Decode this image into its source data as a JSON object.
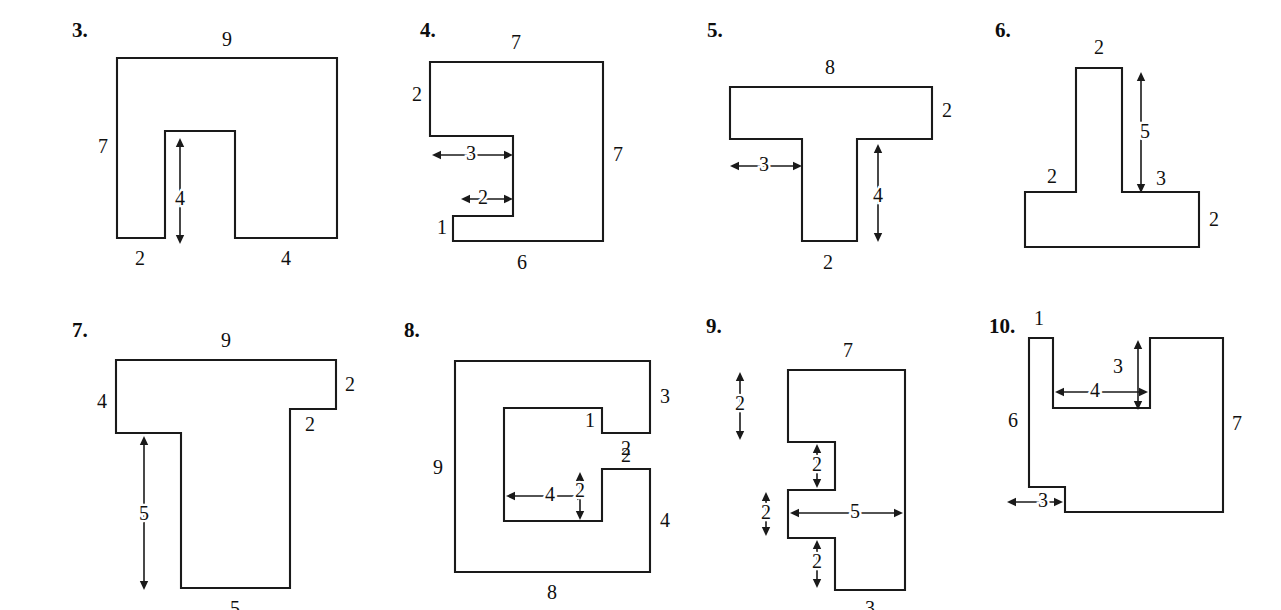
{
  "page": {
    "background_color": "#ffffff",
    "ink_color": "#1a1a1a",
    "problem_count": 8
  },
  "problems": [
    {
      "number": "3.",
      "number_pos": [
        12,
        12
      ],
      "shape": "rectangle-with-bottom-notch",
      "outline": "M 57,50 L 277,50 L 277,230 L 175,230 L 175,123 L 105,123 L 105,230 L 57,230 Z",
      "labels": [
        {
          "text": "9",
          "x": 167,
          "y": 33,
          "name": "dim-top-9",
          "halo": false
        },
        {
          "text": "7",
          "x": 43,
          "y": 140,
          "name": "dim-left-7",
          "halo": false
        },
        {
          "text": "2",
          "x": 80,
          "y": 252,
          "name": "dim-bottom-2",
          "halo": false
        },
        {
          "text": "4",
          "x": 120,
          "y": 192,
          "name": "dim-notch-4",
          "halo": true
        },
        {
          "text": "4",
          "x": 226,
          "y": 252,
          "name": "dim-bottom-4",
          "halo": false
        }
      ],
      "arrows": [
        {
          "x1": 120,
          "y1": 130,
          "x2": 120,
          "y2": 236,
          "heads": "both",
          "name": "arrow-notch-height-4"
        }
      ]
    },
    {
      "number": "4.",
      "number_pos": [
        8,
        12
      ],
      "shape": "z-block",
      "outline": "M 18,54 L 191,54 L 191,233 L 41,233 L 41,208 L 101,208 L 101,128 L 18,128 Z",
      "labels": [
        {
          "text": "7",
          "x": 104,
          "y": 36,
          "name": "dim-top-7",
          "halo": false
        },
        {
          "text": "2",
          "x": 5,
          "y": 88,
          "name": "dim-left-2",
          "halo": false
        },
        {
          "text": "3",
          "x": 59,
          "y": 147,
          "name": "dim-inner-3",
          "halo": true
        },
        {
          "text": "2",
          "x": 71,
          "y": 191,
          "name": "dim-inner-2",
          "halo": true
        },
        {
          "text": "1",
          "x": 30,
          "y": 221,
          "name": "dim-left-1",
          "halo": false
        },
        {
          "text": "7",
          "x": 206,
          "y": 148,
          "name": "dim-right-7",
          "halo": false
        },
        {
          "text": "6",
          "x": 110,
          "y": 256,
          "name": "dim-bottom-6",
          "halo": false
        }
      ],
      "arrows": [
        {
          "x1": 20,
          "y1": 147,
          "x2": 101,
          "y2": 147,
          "heads": "both",
          "name": "arrow-width-3"
        },
        {
          "x1": 49,
          "y1": 191,
          "x2": 101,
          "y2": 191,
          "heads": "both",
          "name": "arrow-width-2"
        }
      ]
    },
    {
      "number": "5.",
      "number_pos": [
        10,
        12
      ],
      "shape": "tee-upright",
      "outline": "M 33,79 L 235,79 L 235,131 L 160,131 L 160,233 L 105,233 L 105,131 L 33,131 Z",
      "labels": [
        {
          "text": "8",
          "x": 133,
          "y": 61,
          "name": "dim-top-8",
          "halo": false
        },
        {
          "text": "2",
          "x": 250,
          "y": 104,
          "name": "dim-right-2",
          "halo": false
        },
        {
          "text": "3",
          "x": 67,
          "y": 158,
          "name": "dim-left-3",
          "halo": true
        },
        {
          "text": "4",
          "x": 181,
          "y": 189,
          "name": "dim-stem-4",
          "halo": true
        },
        {
          "text": "2",
          "x": 131,
          "y": 256,
          "name": "dim-bottom-2",
          "halo": false
        }
      ],
      "arrows": [
        {
          "x1": 33,
          "y1": 158,
          "x2": 105,
          "y2": 158,
          "heads": "both",
          "name": "arrow-left-3"
        },
        {
          "x1": 181,
          "y1": 136,
          "x2": 181,
          "y2": 234,
          "heads": "both",
          "name": "arrow-stem-4"
        }
      ]
    },
    {
      "number": "6.",
      "number_pos": [
        10,
        12
      ],
      "shape": "tee-wide-base",
      "outline": "M 91,60 L 137,60 L 137,184 L 214,184 L 214,239 L 40,239 L 40,184 L 91,184 Z",
      "labels": [
        {
          "text": "2",
          "x": 114,
          "y": 41,
          "name": "dim-top-2",
          "halo": false
        },
        {
          "text": "5",
          "x": 160,
          "y": 125,
          "name": "dim-stem-5",
          "halo": true
        },
        {
          "text": "2",
          "x": 67,
          "y": 170,
          "name": "dim-left-2",
          "halo": false
        },
        {
          "text": "3",
          "x": 176,
          "y": 172,
          "name": "dim-right-3",
          "halo": false
        },
        {
          "text": "2",
          "x": 229,
          "y": 213,
          "name": "dim-base-2",
          "halo": false
        }
      ],
      "arrows": [
        {
          "x1": 156,
          "y1": 64,
          "x2": 156,
          "y2": 185,
          "heads": "both",
          "name": "arrow-stem-5"
        }
      ]
    },
    {
      "number": "7.",
      "number_pos": [
        12,
        10
      ],
      "shape": "tee-stepped",
      "outline": "M 56,50 L 276,50 L 276,99 L 230,99 L 230,278 L 121,278 L 121,123 L 56,123 Z",
      "labels": [
        {
          "text": "9",
          "x": 166,
          "y": 32,
          "name": "dim-top-9",
          "halo": false
        },
        {
          "text": "4",
          "x": 42,
          "y": 93,
          "name": "dim-left-4",
          "halo": false
        },
        {
          "text": "2",
          "x": 290,
          "y": 76,
          "name": "dim-right-2",
          "halo": false
        },
        {
          "text": "2",
          "x": 250,
          "y": 116,
          "name": "dim-step-2",
          "halo": false
        },
        {
          "text": "5",
          "x": 84,
          "y": 205,
          "name": "dim-stem-5",
          "halo": true
        },
        {
          "text": "5",
          "x": 175,
          "y": 300,
          "name": "dim-bottom-5",
          "halo": false
        }
      ],
      "arrows": [
        {
          "x1": 84,
          "y1": 126,
          "x2": 84,
          "y2": 280,
          "heads": "both",
          "name": "arrow-stem-5"
        }
      ]
    },
    {
      "number": "8.",
      "number_pos": [
        4,
        10
      ],
      "shape": "spiral-c-block",
      "outline": "M 55,51 L 250,51 L 250,123 L 202,123 L 202,98 L 104,98 L 104,211 L 202,211 L 202,159 L 250,159 L 250,262 L 55,262 Z",
      "labels": [
        {
          "text": "3",
          "x": 265,
          "y": 88,
          "name": "dim-right-3",
          "halo": false
        },
        {
          "text": "1",
          "x": 190,
          "y": 112,
          "name": "dim-step-1",
          "halo": false
        },
        {
          "text": "2",
          "x": 226,
          "y": 140,
          "name": "dim-step-2",
          "halo": false
        },
        {
          "text": "9",
          "x": 38,
          "y": 159,
          "name": "dim-left-9",
          "halo": false
        },
        {
          "text": "2",
          "x": 226,
          "y": 147,
          "name": "dim-notch-top-2",
          "halo": false
        },
        {
          "text": "4",
          "x": 150,
          "y": 186,
          "name": "dim-inner-4",
          "halo": true
        },
        {
          "text": "2",
          "x": 180,
          "y": 182,
          "name": "dim-inner-2",
          "halo": true
        },
        {
          "text": "4",
          "x": 265,
          "y": 212,
          "name": "dim-right-4",
          "halo": false
        },
        {
          "text": "8",
          "x": 152,
          "y": 284,
          "name": "dim-bottom-8",
          "halo": false
        }
      ],
      "arrows": [
        {
          "x1": 106,
          "y1": 186,
          "x2": 186,
          "y2": 186,
          "heads": "both",
          "name": "arrow-inner-4"
        },
        {
          "x1": 180,
          "y1": 162,
          "x2": 180,
          "y2": 210,
          "heads": "both",
          "name": "arrow-inner-2"
        }
      ]
    },
    {
      "number": "9.",
      "number_pos": [
        6,
        6
      ],
      "shape": "comb-block",
      "outline": "M 88,60 L 205,60 L 205,280 L 135,280 L 135,228 L 88,228 L 88,180 L 135,180 L 135,132 L 88,132 Z",
      "labels": [
        {
          "text": "7",
          "x": 148,
          "y": 42,
          "name": "dim-top-7",
          "halo": false
        },
        {
          "text": "2",
          "x": 40,
          "y": 95,
          "name": "dim-left-2",
          "halo": true
        },
        {
          "text": "2",
          "x": 117,
          "y": 156,
          "name": "dim-tooth-2a",
          "halo": true
        },
        {
          "text": "2",
          "x": 66,
          "y": 204,
          "name": "dim-tooth-2b",
          "halo": true
        },
        {
          "text": "5",
          "x": 155,
          "y": 203,
          "name": "dim-width-5",
          "halo": true
        },
        {
          "text": "2",
          "x": 117,
          "y": 253,
          "name": "dim-tooth-2c",
          "halo": true
        },
        {
          "text": "3",
          "x": 170,
          "y": 300,
          "name": "dim-bottom-3",
          "halo": false
        }
      ],
      "arrows": [
        {
          "x1": 40,
          "y1": 62,
          "x2": 40,
          "y2": 130,
          "heads": "both",
          "name": "arrow-left-2"
        },
        {
          "x1": 117,
          "y1": 134,
          "x2": 117,
          "y2": 178,
          "heads": "both",
          "name": "arrow-tooth-2a"
        },
        {
          "x1": 66,
          "y1": 182,
          "x2": 66,
          "y2": 226,
          "heads": "both",
          "name": "arrow-tooth-2b"
        },
        {
          "x1": 90,
          "y1": 203,
          "x2": 203,
          "y2": 203,
          "heads": "both",
          "name": "arrow-width-5"
        },
        {
          "x1": 117,
          "y1": 230,
          "x2": 117,
          "y2": 278,
          "heads": "both",
          "name": "arrow-tooth-2c"
        }
      ]
    },
    {
      "number": "10.",
      "number_pos": [
        4,
        6
      ],
      "shape": "notched-square",
      "outline": "M 44,28 L 68,28 L 68,98 L 165,98 L 165,28 L 238,28 L 238,202 L 80,202 L 80,177 L 44,177 Z",
      "labels": [
        {
          "text": "1",
          "x": 54,
          "y": 10,
          "name": "dim-top-1",
          "halo": false
        },
        {
          "text": "3",
          "x": 133,
          "y": 58,
          "name": "dim-notch-3",
          "halo": true
        },
        {
          "text": "4",
          "x": 110,
          "y": 82,
          "name": "dim-notch-4",
          "halo": true
        },
        {
          "text": "6",
          "x": 28,
          "y": 112,
          "name": "dim-left-6",
          "halo": false
        },
        {
          "text": "7",
          "x": 252,
          "y": 115,
          "name": "dim-right-7",
          "halo": false
        },
        {
          "text": "3",
          "x": 58,
          "y": 192,
          "name": "dim-bottom-3",
          "halo": true
        }
      ],
      "arrows": [
        {
          "x1": 153,
          "y1": 30,
          "x2": 153,
          "y2": 100,
          "heads": "both",
          "name": "arrow-notch-3"
        },
        {
          "x1": 70,
          "y1": 82,
          "x2": 163,
          "y2": 82,
          "heads": "both",
          "name": "arrow-notch-4"
        },
        {
          "x1": 22,
          "y1": 192,
          "x2": 78,
          "y2": 192,
          "heads": "both",
          "name": "arrow-bottom-3"
        }
      ]
    }
  ],
  "layout": {
    "slots": [
      {
        "left": 60,
        "top": 8,
        "width": 330,
        "height": 290
      },
      {
        "left": 412,
        "top": 8,
        "width": 280,
        "height": 290
      },
      {
        "left": 697,
        "top": 8,
        "width": 290,
        "height": 290
      },
      {
        "left": 985,
        "top": 8,
        "width": 290,
        "height": 290
      },
      {
        "left": 60,
        "top": 310,
        "width": 330,
        "height": 300
      },
      {
        "left": 400,
        "top": 310,
        "width": 300,
        "height": 300
      },
      {
        "left": 700,
        "top": 310,
        "width": 290,
        "height": 300
      },
      {
        "left": 985,
        "top": 310,
        "width": 290,
        "height": 300
      }
    ]
  }
}
